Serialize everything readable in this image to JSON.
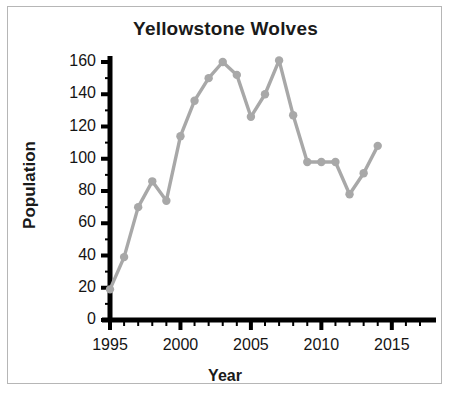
{
  "figure": {
    "title": "Yellowstone Wolves",
    "frame_color": "#b6b6b6",
    "background": "#ffffff"
  },
  "axes": {
    "xlabel": "Year",
    "ylabel": "Population",
    "axis_color": "#000000",
    "y_tick_labels": [
      "0",
      "20",
      "40",
      "60",
      "80",
      "100",
      "120",
      "140",
      "160"
    ],
    "x_tick_labels": [
      "1995",
      "2000",
      "2005",
      "2010",
      "2015"
    ]
  },
  "chart_data": {
    "type": "line",
    "title": "Yellowstone Wolves",
    "xlabel": "Year",
    "ylabel": "Population",
    "xlim": [
      1995,
      2017
    ],
    "ylim": [
      0,
      160
    ],
    "xticks": [
      1995,
      2000,
      2005,
      2010,
      2015
    ],
    "yticks": [
      0,
      20,
      40,
      60,
      80,
      100,
      120,
      140,
      160
    ],
    "minor_xtick_step": 1,
    "minor_ytick_step": 10,
    "grid": false,
    "legend": false,
    "series": [
      {
        "name": "Yellowstone Wolves",
        "color": "#a8a8a8",
        "marker": "circle",
        "x": [
          1995,
          1996,
          1997,
          1998,
          1999,
          2000,
          2001,
          2002,
          2003,
          2004,
          2005,
          2006,
          2007,
          2008,
          2009,
          2010,
          2011,
          2012,
          2013,
          2014
        ],
        "values": [
          19,
          39,
          70,
          86,
          74,
          114,
          136,
          150,
          160,
          152,
          126,
          140,
          161,
          127,
          98,
          98,
          98,
          78,
          91,
          108
        ]
      }
    ]
  }
}
